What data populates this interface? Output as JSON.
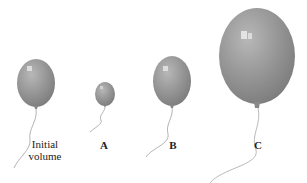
{
  "figure": {
    "balloon_color": "#8f8f8f",
    "highlight_color": "#e6e6e6",
    "string_color": "#9a9a9a",
    "balloons": [
      {
        "id": "initial",
        "label_line1": "Initial",
        "label_line2": "volume",
        "relative_size": "medium"
      },
      {
        "id": "A",
        "label": "A",
        "relative_size": "small"
      },
      {
        "id": "B",
        "label": "B",
        "relative_size": "medium"
      },
      {
        "id": "C",
        "label": "C",
        "relative_size": "large"
      }
    ]
  }
}
